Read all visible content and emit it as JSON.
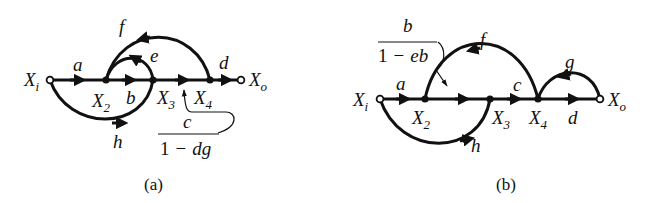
{
  "diagrams": [
    {
      "caption": "(a)",
      "nodes": {
        "input": {
          "main": "X",
          "sub": "i"
        },
        "x2": {
          "main": "X",
          "sub": "2"
        },
        "x3": {
          "main": "X",
          "sub": "3"
        },
        "x4": {
          "main": "X",
          "sub": "4"
        },
        "output": {
          "main": "X",
          "sub": "o"
        }
      },
      "gains": {
        "a": "a",
        "b": "b",
        "d": "d",
        "e": "e",
        "f": "f",
        "h": "h",
        "c_num": "c",
        "c_den_1": "1",
        "c_den_minus": "−",
        "c_den_var": "dg"
      }
    },
    {
      "caption": "(b)",
      "nodes": {
        "input": {
          "main": "X",
          "sub": "i"
        },
        "x2": {
          "main": "X",
          "sub": "2"
        },
        "x3": {
          "main": "X",
          "sub": "3"
        },
        "x4": {
          "main": "X",
          "sub": "4"
        },
        "output": {
          "main": "X",
          "sub": "o"
        }
      },
      "gains": {
        "a": "a",
        "c": "c",
        "d": "d",
        "f": "f",
        "g": "g",
        "h": "h",
        "b_num": "b",
        "b_den_1": "1",
        "b_den_minus": "−",
        "b_den_var": "eb"
      }
    }
  ]
}
